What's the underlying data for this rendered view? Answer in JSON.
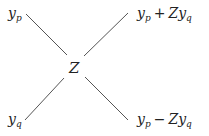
{
  "diagram": {
    "type": "butterfly",
    "center_label": "Z",
    "nodes": {
      "top_left": {
        "base": "y",
        "sub": "p"
      },
      "bottom_left": {
        "base": "y",
        "sub": "q"
      },
      "top_right": {
        "a_base": "y",
        "a_sub": "p",
        "op": "+",
        "b_coef": "Z",
        "b_base": "y",
        "b_sub": "q"
      },
      "bottom_right": {
        "a_base": "y",
        "a_sub": "p",
        "op": "−",
        "b_coef": "Z",
        "b_base": "y",
        "b_sub": "q"
      }
    },
    "line_color": "#555555"
  }
}
